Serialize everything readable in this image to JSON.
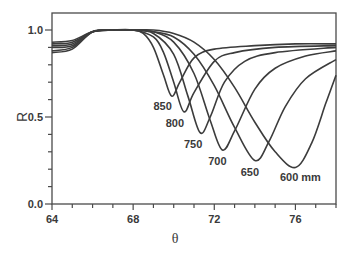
{
  "chart_data": {
    "type": "line",
    "title": "",
    "xlabel": "θ",
    "ylabel": "R",
    "xlim": [
      64,
      78
    ],
    "ylim": [
      0.0,
      1.07
    ],
    "xticks": [
      64,
      68,
      72,
      76
    ],
    "xtick_labels": [
      "64",
      "68",
      "72",
      "76"
    ],
    "x_minor_step": 1,
    "yticks": [
      0.0,
      0.5,
      1.0
    ],
    "ytick_labels": [
      "0.0",
      "0.5",
      "1.0"
    ],
    "y_minor_step": 0.1,
    "grid": false,
    "legend": "inline curve labels",
    "series": [
      {
        "name": "850",
        "label": "850",
        "min_theta": 69.9,
        "min_R": 0.62,
        "R_at_64": 0.93,
        "R_at_78": 0.92,
        "points": [
          [
            64,
            0.93
          ],
          [
            65,
            0.94
          ],
          [
            66,
            0.99
          ],
          [
            67,
            1.0
          ],
          [
            68,
            1.0
          ],
          [
            68.5,
            0.98
          ],
          [
            69,
            0.9
          ],
          [
            69.5,
            0.74
          ],
          [
            69.9,
            0.62
          ],
          [
            70.3,
            0.7
          ],
          [
            71,
            0.84
          ],
          [
            72,
            0.89
          ],
          [
            74,
            0.91
          ],
          [
            76,
            0.92
          ],
          [
            78,
            0.92
          ]
        ]
      },
      {
        "name": "800",
        "label": "800",
        "min_theta": 70.5,
        "min_R": 0.53,
        "R_at_64": 0.92,
        "R_at_78": 0.91,
        "points": [
          [
            64,
            0.92
          ],
          [
            65,
            0.93
          ],
          [
            66,
            0.99
          ],
          [
            67,
            1.0
          ],
          [
            68,
            1.0
          ],
          [
            69,
            0.96
          ],
          [
            69.5,
            0.87
          ],
          [
            70,
            0.7
          ],
          [
            70.5,
            0.53
          ],
          [
            71,
            0.64
          ],
          [
            72,
            0.82
          ],
          [
            73,
            0.87
          ],
          [
            75,
            0.9
          ],
          [
            78,
            0.91
          ]
        ]
      },
      {
        "name": "750",
        "label": "750",
        "min_theta": 71.3,
        "min_R": 0.41,
        "R_at_64": 0.91,
        "R_at_78": 0.9,
        "points": [
          [
            64,
            0.91
          ],
          [
            65,
            0.92
          ],
          [
            66,
            0.99
          ],
          [
            67,
            1.0
          ],
          [
            68,
            1.0
          ],
          [
            69,
            0.98
          ],
          [
            70,
            0.86
          ],
          [
            70.7,
            0.62
          ],
          [
            71.3,
            0.41
          ],
          [
            71.8,
            0.5
          ],
          [
            72.5,
            0.7
          ],
          [
            73.5,
            0.82
          ],
          [
            75,
            0.87
          ],
          [
            78,
            0.9
          ]
        ]
      },
      {
        "name": "700",
        "label": "700",
        "min_theta": 72.4,
        "min_R": 0.31,
        "R_at_64": 0.9,
        "R_at_78": 0.88,
        "points": [
          [
            64,
            0.9
          ],
          [
            65,
            0.91
          ],
          [
            66,
            0.99
          ],
          [
            67,
            1.0
          ],
          [
            68,
            1.0
          ],
          [
            69,
            0.99
          ],
          [
            70,
            0.93
          ],
          [
            71,
            0.75
          ],
          [
            71.8,
            0.48
          ],
          [
            72.4,
            0.31
          ],
          [
            73,
            0.42
          ],
          [
            74,
            0.66
          ],
          [
            75,
            0.78
          ],
          [
            76.5,
            0.85
          ],
          [
            78,
            0.88
          ]
        ]
      },
      {
        "name": "650",
        "label": "650",
        "min_theta": 74.0,
        "min_R": 0.25,
        "R_at_64": 0.88,
        "R_at_78": 0.83,
        "points": [
          [
            64,
            0.88
          ],
          [
            65,
            0.9
          ],
          [
            66,
            0.99
          ],
          [
            67,
            1.0
          ],
          [
            68,
            1.0
          ],
          [
            69,
            0.99
          ],
          [
            70,
            0.96
          ],
          [
            71,
            0.86
          ],
          [
            72,
            0.68
          ],
          [
            73,
            0.44
          ],
          [
            74,
            0.25
          ],
          [
            74.7,
            0.36
          ],
          [
            75.5,
            0.56
          ],
          [
            76.5,
            0.72
          ],
          [
            78,
            0.83
          ]
        ]
      },
      {
        "name": "600",
        "label": "600 mm",
        "min_theta": 76.0,
        "min_R": 0.21,
        "R_at_64": 0.87,
        "R_at_78": 0.74,
        "points": [
          [
            64,
            0.87
          ],
          [
            65,
            0.89
          ],
          [
            66,
            0.99
          ],
          [
            67,
            1.0
          ],
          [
            68,
            1.0
          ],
          [
            69,
            1.0
          ],
          [
            70,
            0.98
          ],
          [
            71,
            0.93
          ],
          [
            72,
            0.83
          ],
          [
            73,
            0.67
          ],
          [
            74,
            0.47
          ],
          [
            75,
            0.3
          ],
          [
            76,
            0.21
          ],
          [
            76.8,
            0.35
          ],
          [
            77.5,
            0.58
          ],
          [
            78,
            0.74
          ]
        ]
      }
    ]
  }
}
